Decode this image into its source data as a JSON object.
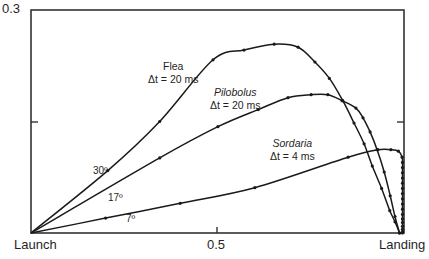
{
  "chart_data": {
    "type": "line",
    "title": "",
    "xlabel": "",
    "ylabel": "",
    "xlim": [
      0,
      1
    ],
    "ylim": [
      0,
      0.3
    ],
    "grid": false,
    "x_tick_labels": [
      {
        "x": 0,
        "label": "Launch"
      },
      {
        "x": 0.5,
        "label": "0.5"
      },
      {
        "x": 1,
        "label": "Landing"
      }
    ],
    "y_tick_labels": [
      {
        "y": 0.3,
        "label": "0.3"
      },
      {
        "y": 0.15,
        "label": ""
      }
    ],
    "series": [
      {
        "name": "Flea",
        "dt_label": "Δt = 20 ms",
        "launch_angle": "30º",
        "x": [
          0,
          0.206,
          0.345,
          0.488,
          0.571,
          0.652,
          0.716,
          0.761,
          0.8,
          0.836,
          0.866,
          0.893,
          0.915,
          0.94,
          0.962,
          0.976,
          0.988
        ],
        "y": [
          0,
          0.084,
          0.15,
          0.233,
          0.246,
          0.254,
          0.25,
          0.23,
          0.208,
          0.178,
          0.148,
          0.12,
          0.09,
          0.06,
          0.03,
          0.015,
          0
        ]
      },
      {
        "name": "Pilobolus",
        "dt_label": "Δt = 20 ms",
        "launch_angle": "17º",
        "x": [
          0,
          0.345,
          0.501,
          0.609,
          0.689,
          0.751,
          0.796,
          0.834,
          0.871,
          0.89,
          0.909,
          0.928,
          0.947,
          0.963,
          0.976,
          0.988
        ],
        "y": [
          0,
          0.101,
          0.143,
          0.166,
          0.182,
          0.186,
          0.186,
          0.178,
          0.168,
          0.155,
          0.136,
          0.112,
          0.082,
          0.05,
          0.022,
          0
        ]
      },
      {
        "name": "Sordaria",
        "dt_label": "Δt = 4 ms",
        "launch_angle": "7º",
        "x": [
          0,
          0.2,
          0.4,
          0.6,
          0.85,
          0.93,
          0.965,
          0.985,
          0.995,
          0.996,
          0.996,
          0.996,
          0.996,
          0.996,
          0.996,
          0.996,
          0.996,
          0.996,
          0.996,
          0.996,
          0.996,
          0.996,
          0.996,
          0.996,
          0.996,
          0.996
        ],
        "y": [
          0,
          0.02,
          0.04,
          0.061,
          0.102,
          0.112,
          0.112,
          0.11,
          0.102,
          0.095,
          0.088,
          0.081,
          0.074,
          0.067,
          0.06,
          0.053,
          0.046,
          0.039,
          0.032,
          0.025,
          0.019,
          0.014,
          0.009,
          0.005,
          0.002,
          0
        ]
      }
    ],
    "annotations": [
      {
        "text": "Flea",
        "sub": "Δt = 20 ms"
      },
      {
        "text": "Pilobolus",
        "sub": "Δt = 20 ms",
        "italic": true
      },
      {
        "text": "Sordaria",
        "sub": "Δt = 4 ms",
        "italic": true
      },
      {
        "text": "30º"
      },
      {
        "text": "17º"
      },
      {
        "text": "7º"
      }
    ],
    "legend_position": "inline-annotations"
  },
  "labels": {
    "y_top": "0.3",
    "x_launch": "Launch",
    "x_mid": "0.5",
    "x_landing": "Landing",
    "flea_name": "Flea",
    "flea_dt": "Δt = 20 ms",
    "pilobolus_name": "Pilobolus",
    "pilobolus_dt": "Δt = 20 ms",
    "sordaria_name": "Sordaria",
    "sordaria_dt": "Δt = 4 ms",
    "angle_30": "30º",
    "angle_17": "17º",
    "angle_7": "7º"
  },
  "style": {
    "line_color": "#1a1a1a",
    "axis_color": "#333333"
  }
}
